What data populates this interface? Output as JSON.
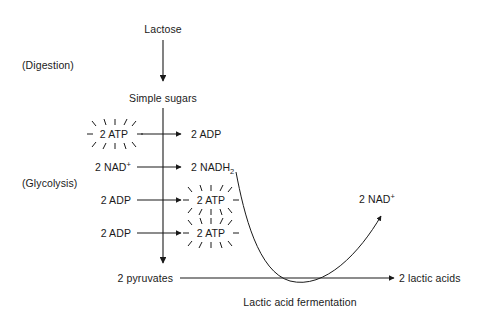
{
  "diagram": {
    "stroke_color": "#1a1a1a",
    "background_color": "#ffffff",
    "stages": {
      "digestion_label": "(Digestion)",
      "glycolysis_label": "(Glycolysis)"
    },
    "nodes": {
      "lactose": "Lactose",
      "simple_sugars": "Simple sugars",
      "pyruvates": "2 pyruvates",
      "lactic_acids": "2 lactic acids"
    },
    "glycolysis_rows": [
      {
        "left": "2 ATP",
        "left_burst": true,
        "right": "2 ADP",
        "right_burst": false
      },
      {
        "left": "2 NAD",
        "left_super": "+",
        "left_burst": false,
        "right": "2 NADH",
        "right_sub": "2",
        "right_burst": false
      },
      {
        "left": "2 ADP",
        "left_burst": false,
        "right": "2 ATP",
        "right_burst": true
      },
      {
        "left": "2 ADP",
        "left_burst": false,
        "right": "2 ATP",
        "right_burst": true
      }
    ],
    "fermentation": {
      "caption": "Lactic acid fermentation",
      "product": "2 NAD",
      "product_super": "+"
    }
  }
}
